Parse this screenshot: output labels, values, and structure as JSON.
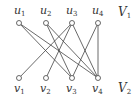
{
  "diagram": {
    "type": "bipartite-graph",
    "top_set": {
      "label": "V",
      "subscript": "1",
      "x": 118,
      "y": 16
    },
    "bottom_set": {
      "label": "V",
      "subscript": "2",
      "x": 118,
      "y": 92
    },
    "nodes": [
      {
        "id": "u1",
        "name": "u",
        "sub": "1",
        "x": 19,
        "y": 23,
        "lx": 14,
        "ly": 14
      },
      {
        "id": "u2",
        "name": "u",
        "sub": "2",
        "x": 46,
        "y": 23,
        "lx": 40,
        "ly": 14
      },
      {
        "id": "u3",
        "name": "u",
        "sub": "3",
        "x": 72,
        "y": 23,
        "lx": 66,
        "ly": 14
      },
      {
        "id": "u4",
        "name": "u",
        "sub": "4",
        "x": 98,
        "y": 23,
        "lx": 92,
        "ly": 14
      },
      {
        "id": "v1",
        "name": "v",
        "sub": "1",
        "x": 19,
        "y": 78,
        "lx": 14,
        "ly": 92
      },
      {
        "id": "v2",
        "name": "v",
        "sub": "2",
        "x": 46,
        "y": 78,
        "lx": 40,
        "ly": 92
      },
      {
        "id": "v3",
        "name": "v",
        "sub": "3",
        "x": 72,
        "y": 78,
        "lx": 66,
        "ly": 92
      },
      {
        "id": "v4",
        "name": "v",
        "sub": "4",
        "x": 98,
        "y": 78,
        "lx": 92,
        "ly": 92
      }
    ],
    "edges": [
      [
        "u1",
        "v3"
      ],
      [
        "u1",
        "v4"
      ],
      [
        "u2",
        "v3"
      ],
      [
        "u2",
        "v4"
      ],
      [
        "u3",
        "v1"
      ],
      [
        "u3",
        "v2"
      ],
      [
        "u3",
        "v4"
      ],
      [
        "u4",
        "v3"
      ],
      [
        "u4",
        "v4"
      ]
    ],
    "colors": {
      "stroke": "#444444",
      "text": "#333333"
    }
  }
}
